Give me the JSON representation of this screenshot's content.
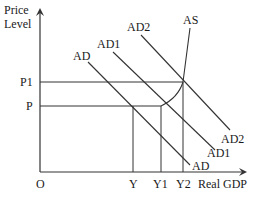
{
  "diagram": {
    "type": "AD-AS economics diagram",
    "y_axis": {
      "label_line1": "Price",
      "label_line2": "Level"
    },
    "x_axis": {
      "label": "Real GDP"
    },
    "origin_label": "O",
    "price_levels": [
      {
        "label": "P1"
      },
      {
        "label": "P"
      }
    ],
    "output_levels": [
      {
        "label": "Y"
      },
      {
        "label": "Y1"
      },
      {
        "label": "Y2"
      }
    ],
    "curves": {
      "as": {
        "label": "AS"
      },
      "ad": {
        "top_label": "AD",
        "bottom_label": "AD"
      },
      "ad1": {
        "top_label": "AD1",
        "bottom_label": "AD1"
      },
      "ad2": {
        "top_label": "AD2",
        "bottom_label": "AD2"
      }
    },
    "line_color": "#333333"
  }
}
